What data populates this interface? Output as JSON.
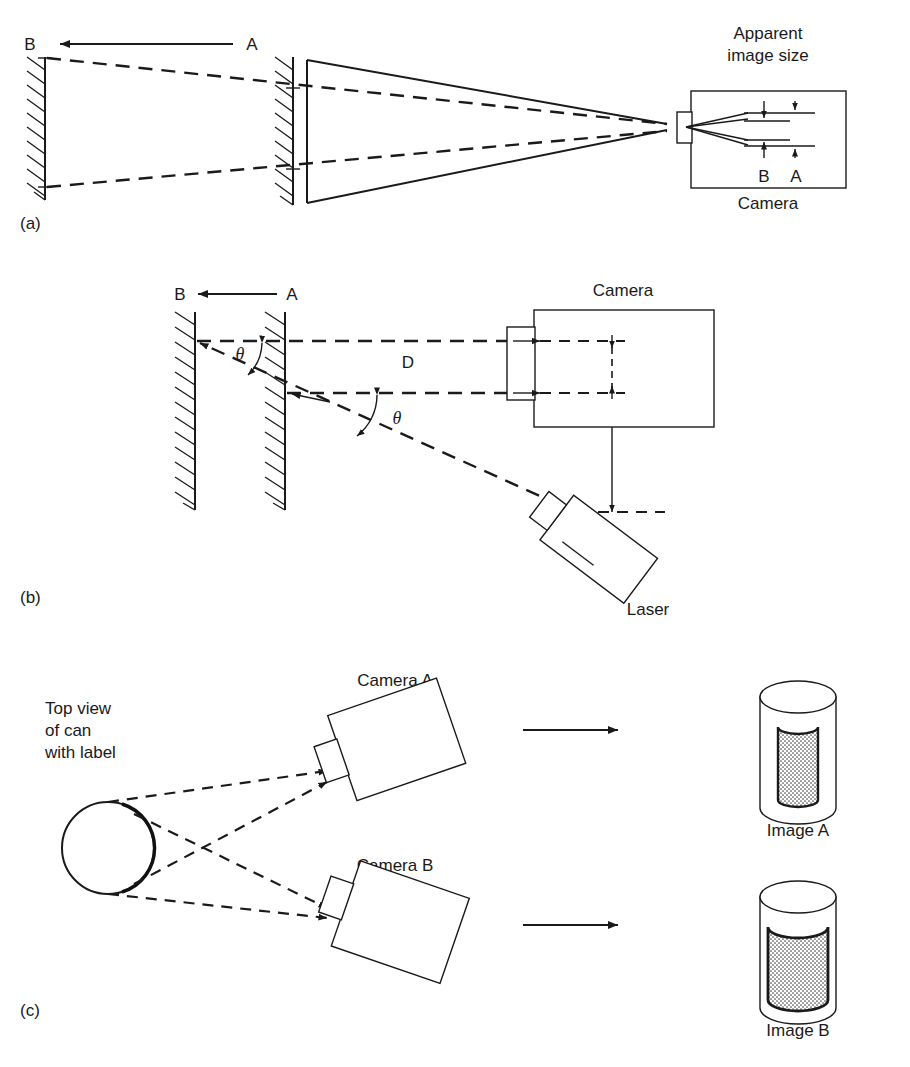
{
  "figure": {
    "panels": [
      {
        "id": "a",
        "label": "(a)",
        "caption_labels": {
          "position_b": "B",
          "position_a": "A",
          "apparent_image_size": "Apparent\nimage size",
          "apparent_line1": "Apparent",
          "apparent_line2": "image size",
          "camera": "Camera",
          "image_b": "B",
          "image_a": "A"
        }
      },
      {
        "id": "b",
        "label": "(b)",
        "caption_labels": {
          "position_b": "B",
          "position_a": "A",
          "theta_upper": "θ",
          "theta_lower": "θ",
          "distance_d": "D",
          "camera": "Camera",
          "laser": "Laser"
        }
      },
      {
        "id": "c",
        "label": "(c)",
        "caption_labels": {
          "top_view_line1": "Top view",
          "top_view_line2": "of can",
          "top_view_line3": "with label",
          "camera_a": "Camera A",
          "camera_b": "Camera B",
          "image_a": "Image A",
          "image_b": "Image B"
        }
      }
    ]
  },
  "colors": {
    "ink": "#1a1a1a",
    "background": "#ffffff",
    "hatch_fill": "#cccccc",
    "label_shade": "#b8b8b8"
  }
}
